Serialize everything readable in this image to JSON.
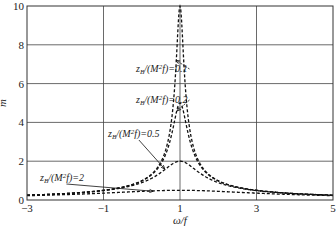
{
  "chart_data": {
    "type": "line",
    "title": "",
    "xlabel": "ω/f",
    "ylabel": "m",
    "xlim": [
      -3,
      5
    ],
    "ylim": [
      0,
      10
    ],
    "xticks": [
      -3,
      -1,
      1,
      3,
      5
    ],
    "yticks": [
      0,
      2,
      4,
      6,
      8,
      10
    ],
    "grid": true,
    "model": "m = 1 / sqrt((ω/f - 1)^2 + (z_B/(M²f))^2)",
    "series": [
      {
        "name": "z_B/(M²f)=0.1",
        "param": 0.1,
        "peak": 10.0,
        "style": "dashed",
        "x": [
          -3,
          -1,
          0,
          0.5,
          0.8,
          0.9,
          1,
          1.1,
          1.2,
          1.5,
          2,
          3,
          5
        ],
        "values": [
          0.25,
          0.5,
          0.99,
          1.96,
          4.47,
          7.07,
          10.0,
          7.07,
          4.47,
          1.96,
          0.99,
          0.5,
          0.25
        ]
      },
      {
        "name": "z_B/(M²f)=0.2",
        "param": 0.2,
        "peak": 5.0,
        "style": "dashed",
        "x": [
          -3,
          -1,
          0,
          0.5,
          0.8,
          0.9,
          1,
          1.1,
          1.2,
          1.5,
          2,
          3,
          5
        ],
        "values": [
          0.25,
          0.5,
          0.98,
          1.86,
          3.54,
          4.47,
          5.0,
          4.47,
          3.54,
          1.86,
          0.98,
          0.5,
          0.25
        ]
      },
      {
        "name": "z_B/(M²f)=0.5",
        "param": 0.5,
        "peak": 2.0,
        "style": "dashed",
        "x": [
          -3,
          -1,
          0,
          0.5,
          0.8,
          0.9,
          1,
          1.1,
          1.2,
          1.5,
          2,
          3,
          5
        ],
        "values": [
          0.25,
          0.49,
          0.89,
          1.41,
          1.86,
          1.96,
          2.0,
          1.96,
          1.86,
          1.41,
          0.89,
          0.49,
          0.25
        ]
      },
      {
        "name": "z_B/(M²f)=2",
        "param": 2,
        "peak": 0.5,
        "style": "dashed",
        "x": [
          -3,
          -1,
          0,
          0.5,
          1,
          1.5,
          2,
          3,
          5
        ],
        "values": [
          0.22,
          0.35,
          0.45,
          0.49,
          0.5,
          0.49,
          0.45,
          0.35,
          0.22
        ]
      }
    ],
    "annotations": [
      {
        "text_pre": "z",
        "sub": "B",
        "text_post": "/(M",
        "sup": "2",
        "text_end": "f)=0.1",
        "arrow_to": [
          0.9,
          7.2
        ]
      },
      {
        "text_pre": "z",
        "sub": "B",
        "text_post": "/(M",
        "sup": "2",
        "text_end": "f)=0.2",
        "arrow_to": [
          0.93,
          4.6
        ]
      },
      {
        "text_pre": "z",
        "sub": "B",
        "text_post": "/(M",
        "sup": "2",
        "text_end": "f)=0.5",
        "arrow_to": [
          0.6,
          1.6
        ]
      },
      {
        "text_pre": "z",
        "sub": "B",
        "text_post": "/(M",
        "sup": "2",
        "text_end": "f)=2",
        "arrow_to": [
          0.3,
          0.45
        ]
      }
    ]
  },
  "labels": {
    "xlabel": "ω/f",
    "ylabel": "m",
    "caption": "figure caption (illegible, cropped)"
  }
}
